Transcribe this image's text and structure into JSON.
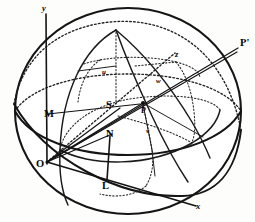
{
  "figure": {
    "kind": "geometric-line-diagram",
    "background_color": "#fdfdfb",
    "ink_color": "#151515",
    "width": 255,
    "height": 222
  },
  "axes": [
    {
      "id": "y-axis",
      "label": "y",
      "label_x": 44,
      "label_y": 10,
      "from": [
        47,
        162
      ],
      "to": [
        46,
        14
      ],
      "style": "solid"
    },
    {
      "id": "x-axis",
      "label": "x",
      "label_x": 199,
      "label_y": 208,
      "from": [
        47,
        162
      ],
      "to": [
        196,
        206
      ],
      "style": "solid"
    },
    {
      "id": "z-axis",
      "label": "z",
      "label_x": 177,
      "label_y": 56,
      "from": [
        47,
        162
      ],
      "to": [
        175,
        52
      ],
      "style": "dotted"
    }
  ],
  "points": [
    {
      "id": "point-O",
      "label": "O",
      "x": 47,
      "y": 162,
      "label_dx": -10,
      "label_dy": 5,
      "note": "origin / center-front of sphere"
    },
    {
      "id": "point-M",
      "label": "M",
      "x": 62,
      "y": 113,
      "label_dx": -16,
      "label_dy": 3,
      "note": "point on left of sphere"
    },
    {
      "id": "point-N",
      "label": "N",
      "x": 110,
      "y": 140,
      "label_dx": -2,
      "label_dy": -5,
      "note": "foot of projection"
    },
    {
      "id": "point-L",
      "label": "L",
      "x": 106,
      "y": 178,
      "label_dx": -2,
      "label_dy": 10,
      "note": "base of vertical drop"
    },
    {
      "id": "point-S",
      "label": "S",
      "x": 116,
      "y": 104,
      "label_dx": -8,
      "label_dy": 4,
      "note": "label left of P"
    },
    {
      "id": "point-P",
      "label": "P",
      "x": 143,
      "y": 103,
      "label_dx": 0,
      "label_dy": 9,
      "note": "point on sphere surface"
    },
    {
      "id": "point-P-prime",
      "label": "P'",
      "x": 238,
      "y": 47,
      "label_dx": 4,
      "label_dy": -2,
      "note": "end of extended ray OP"
    }
  ],
  "angle_labels": [
    {
      "id": "angle-u",
      "label": "u",
      "x": 105,
      "y": 71
    },
    {
      "id": "angle-w",
      "label": "w",
      "x": 159,
      "y": 80
    },
    {
      "id": "angle-v",
      "label": "v",
      "x": 149,
      "y": 130
    }
  ],
  "sphere": {
    "center_x": 128,
    "center_y": 111,
    "radius_x": 114,
    "radius_y": 104
  },
  "legend_note": "Sphere drawn with equatorial and meridian great circles; dotted arcs indicate hidden (far-side) portions."
}
